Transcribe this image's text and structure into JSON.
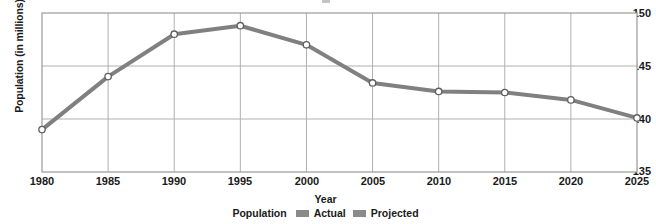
{
  "chart_data": {
    "type": "line",
    "title": "",
    "xlabel": "Year",
    "ylabel": "Population (in millions)",
    "x": [
      1980,
      1985,
      1990,
      1995,
      2000,
      2005,
      2010,
      2015,
      2020,
      2025
    ],
    "categories": [
      "1980",
      "1985",
      "1990",
      "1995",
      "2000",
      "2005",
      "2010",
      "2015",
      "2020",
      "2025"
    ],
    "values": [
      139.0,
      144.0,
      148.0,
      148.8,
      147.0,
      143.4,
      142.6,
      142.5,
      141.8,
      140.1
    ],
    "series": [
      {
        "name": "Actual",
        "x": [
          1980,
          1985,
          1990,
          1995,
          2000
        ],
        "values": [
          139.0,
          144.0,
          148.0,
          148.8,
          147.0
        ],
        "color": "#808080"
      },
      {
        "name": "Projected",
        "x": [
          2000,
          2005,
          2010,
          2015,
          2020,
          2025
        ],
        "values": [
          147.0,
          143.4,
          142.6,
          142.5,
          141.8,
          140.1
        ],
        "color": "#8a8a8a"
      }
    ],
    "xlim": [
      1980,
      2025
    ],
    "ylim": [
      135,
      150
    ],
    "yticks": [
      135,
      140,
      145,
      150
    ],
    "ytick_labels": [
      "135",
      "140",
      "145",
      "150"
    ],
    "xticks": [
      1980,
      1985,
      1990,
      1995,
      2000,
      2005,
      2010,
      2015,
      2020,
      2025
    ],
    "grid": true,
    "grid_color": "#b0b0b0",
    "legend_position": "bottom",
    "marker": "open-circle",
    "line_color": "#808080",
    "line_width": 4
  },
  "legend": {
    "title": "Population",
    "entries": [
      {
        "label": "Actual",
        "color": "#8a8a8a"
      },
      {
        "label": "Projected",
        "color": "#8a8a8a"
      }
    ]
  },
  "axes": {
    "x_title": "Year",
    "y_title": "Population (in millions)",
    "y_tick_0": "135",
    "y_tick_1": "140",
    "y_tick_2": "145",
    "y_tick_3": "150",
    "x_tick_0": "1980",
    "x_tick_1": "1985",
    "x_tick_2": "1990",
    "x_tick_3": "1995",
    "x_tick_4": "2000",
    "x_tick_5": "2005",
    "x_tick_6": "2010",
    "x_tick_7": "2015",
    "x_tick_8": "2020",
    "x_tick_9": "2025"
  }
}
